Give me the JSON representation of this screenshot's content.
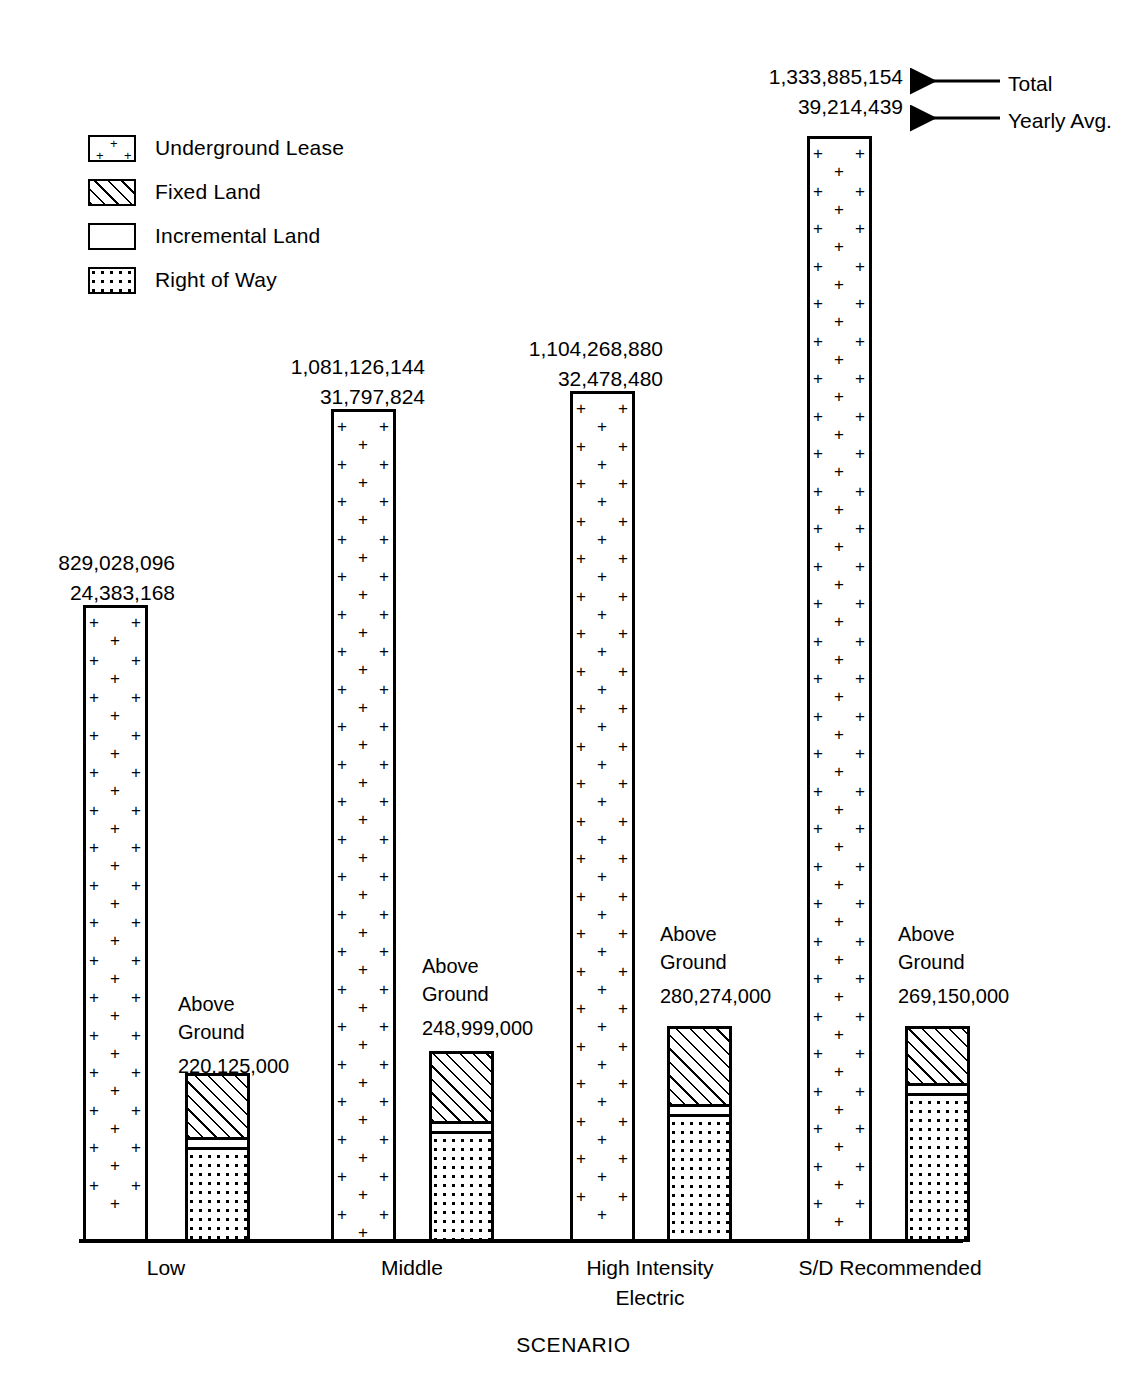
{
  "legend": {
    "items": [
      {
        "label": "Underground Lease",
        "pattern": "underground-lease-plus",
        "icon": "legend-swatch-underground"
      },
      {
        "label": "Fixed Land",
        "pattern": "diagonal-hatch",
        "icon": "legend-swatch-fixed"
      },
      {
        "label": "Incremental Land",
        "pattern": "solid-white",
        "icon": "legend-swatch-incremental"
      },
      {
        "label": "Right of Way",
        "pattern": "dotted",
        "icon": "legend-swatch-rightofway"
      }
    ]
  },
  "annotations": {
    "total_label": "Total",
    "yearly_avg_label": "Yearly Avg."
  },
  "axis": {
    "x_title": "SCENARIO"
  },
  "chart_data": {
    "type": "bar",
    "title": "",
    "xlabel": "SCENARIO",
    "ylabel": "",
    "grid": false,
    "legend_position": "top-left",
    "categories": [
      "Low",
      "Middle",
      "High Intensity\nElectric",
      "S/D Recommended"
    ],
    "series": [
      {
        "name": "Underground Lease",
        "role": "total",
        "values": [
          829028096,
          1081126144,
          1104268880,
          1333885154
        ],
        "value_labels": [
          "829,028,096",
          "1,081,126,144",
          "1,104,268,880",
          "1,333,885,154"
        ]
      },
      {
        "name": "Yearly Avg.",
        "role": "yearly-average",
        "values": [
          24383168,
          31797824,
          32478480,
          39214439
        ],
        "value_labels": [
          "24,383,168",
          "31,797,824",
          "32,478,480",
          "39,214,439"
        ]
      },
      {
        "name": "Above Ground",
        "role": "above-ground-total",
        "values": [
          220125000,
          248999000,
          280274000,
          269150000
        ],
        "value_labels": [
          "220,125,000",
          "248,999,000",
          "280,274,000",
          "269,150,000"
        ],
        "caption": "Above\nGround",
        "segments": [
          "Fixed Land",
          "Incremental Land",
          "Right of Way"
        ]
      }
    ],
    "bars": [
      {
        "category": "Low",
        "underground": {
          "label_total": "829,028,096",
          "label_yearly": "24,383,168",
          "value": 829028096
        },
        "above_ground": {
          "caption_line1": "Above",
          "caption_line2": "Ground",
          "value_label": "220,125,000",
          "value": 220125000,
          "fixed_land_share": 0.46,
          "incremental_land_share": 0.04,
          "right_of_way_share": 0.5
        }
      },
      {
        "category": "Middle",
        "underground": {
          "label_total": "1,081,126,144",
          "label_yearly": "31,797,824",
          "value": 1081126144
        },
        "above_ground": {
          "caption_line1": "Above",
          "caption_line2": "Ground",
          "value_label": "248,999,000",
          "value": 248999000,
          "fixed_land_share": 0.43,
          "incremental_land_share": 0.04,
          "right_of_way_share": 0.53
        }
      },
      {
        "category": "High Intensity Electric",
        "underground": {
          "label_total": "1,104,268,880",
          "label_yearly": "32,478,480",
          "value": 1104268880
        },
        "above_ground": {
          "caption_line1": "Above",
          "caption_line2": "Ground",
          "value_label": "280,274,000",
          "value": 280274000,
          "fixed_land_share": 0.45,
          "incremental_land_share": 0.035,
          "right_of_way_share": 0.515
        }
      },
      {
        "category": "S/D Recommended",
        "underground": {
          "label_total": "1,333,885,154",
          "label_yearly": "39,214,439",
          "value": 1333885154
        },
        "above_ground": {
          "caption_line1": "Above",
          "caption_line2": "Ground",
          "value_label": "269,150,000",
          "value": 269150000,
          "fixed_land_share": 0.32,
          "incremental_land_share": 0.035,
          "right_of_way_share": 0.645
        }
      }
    ]
  },
  "categories_display": {
    "c0": "Low",
    "c1": "Middle",
    "c2": "High Intensity\nElectric",
    "c3": "S/D Recommended"
  }
}
